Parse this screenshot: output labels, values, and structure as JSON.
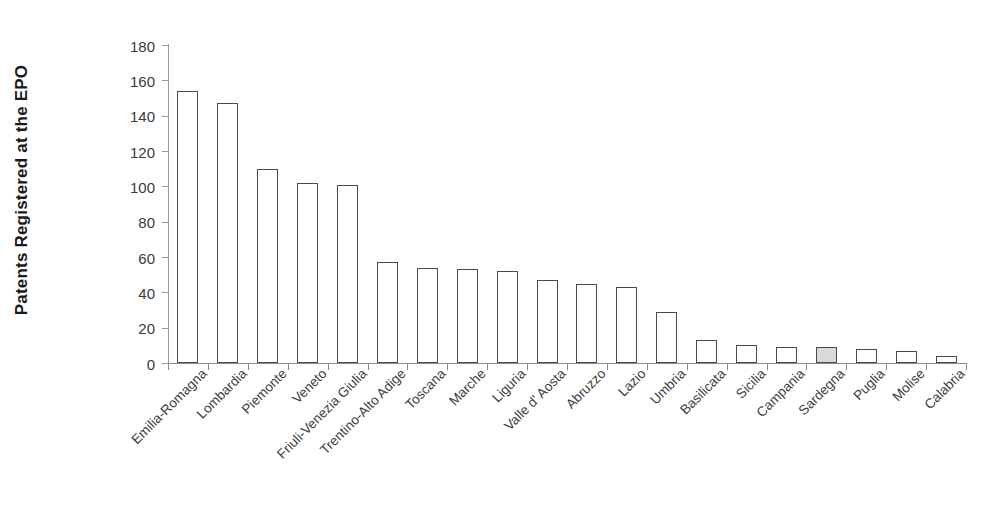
{
  "chart_data": {
    "type": "bar",
    "title": "",
    "subtitle": "",
    "xlabel": "",
    "ylabel": "Patents Registered at the EPO",
    "ylim": [
      0,
      180
    ],
    "yticks": [
      0,
      20,
      40,
      60,
      80,
      100,
      120,
      140,
      160,
      180
    ],
    "ytick_labels": [
      "0",
      "20",
      "40",
      "60",
      "80",
      "100",
      "120",
      "140",
      "160",
      "180"
    ],
    "grid": false,
    "legend": null,
    "legend_position": "none",
    "bar_style": {
      "fill": "#ffffff",
      "edge": "#4a4a4a",
      "highlight_fill": "#d9d9d9",
      "highlight_category": "Sardegna"
    },
    "axis_color": "#8d8d8d",
    "categories": [
      "Emilia-Romagna",
      "Lombardia",
      "Piemonte",
      "Veneto",
      "Friuli-Venezia Giulia",
      "Trentino-Alto Adige",
      "Toscana",
      "Marche",
      "Liguria",
      "Valle d' Aosta",
      "Abruzzo",
      "Lazio",
      "Umbria",
      "Basilicata",
      "Sicilia",
      "Campania",
      "Sardegna",
      "Puglia",
      "Molise",
      "Calabria"
    ],
    "values": [
      154,
      147,
      110,
      102,
      101,
      57,
      54,
      53,
      52,
      47,
      45,
      43,
      29,
      13,
      10,
      9,
      9,
      8,
      7,
      4
    ],
    "highlighted": [
      false,
      false,
      false,
      false,
      false,
      false,
      false,
      false,
      false,
      false,
      false,
      false,
      false,
      false,
      false,
      false,
      true,
      false,
      false,
      false
    ]
  }
}
